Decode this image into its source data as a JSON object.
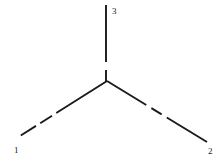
{
  "figure": {
    "background_color": "#ffffff",
    "line_color": "#1a1a1a",
    "label_color": "#1a1a1a",
    "width": 224,
    "height": 164,
    "vertex": {
      "x": 107,
      "y": 81
    },
    "legs": [
      {
        "id": "leg-1",
        "label": "1",
        "label_x": 14,
        "label_y": 151,
        "start_x": 107,
        "start_y": 81,
        "end_x": 12,
        "end_y": 141,
        "stroke_width": 1.9,
        "dash_pattern": "60 5 14 5 18"
      },
      {
        "id": "leg-2",
        "label": "2",
        "label_x": 208,
        "label_y": 152,
        "start_x": 107,
        "start_y": 81,
        "end_x": 207,
        "end_y": 142,
        "stroke_width": 1.9,
        "dash_pattern": "46 6 12 6 48"
      },
      {
        "id": "leg-3",
        "label": "3",
        "label_x": 112,
        "label_y": 12,
        "start_x": 106,
        "start_y": 81,
        "end_x": 106,
        "end_y": 5,
        "stroke_width": 1.9,
        "dash_pattern": "11 8 57"
      }
    ]
  },
  "chart_data": {
    "type": "diagram",
    "title": "",
    "nodes": [
      {
        "name": "vertex",
        "x": 107,
        "y": 81
      }
    ],
    "edges": [
      {
        "name": "1",
        "from": "vertex",
        "to_x": 12,
        "to_y": 141,
        "style": "dashed"
      },
      {
        "name": "2",
        "from": "vertex",
        "to_x": 207,
        "to_y": 142,
        "style": "dashed"
      },
      {
        "name": "3",
        "from": "vertex",
        "to_x": 106,
        "to_y": 5,
        "style": "dashed"
      }
    ],
    "labels": [
      "1",
      "2",
      "3"
    ]
  }
}
